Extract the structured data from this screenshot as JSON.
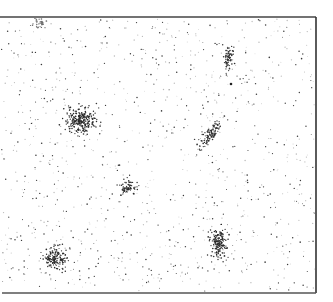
{
  "figure": {
    "width": 333,
    "height": 302,
    "background": "#ffffff",
    "frame": {
      "top_y": 17,
      "right_x": 316,
      "bottom_y": 293,
      "left_x": 0,
      "top_line": {
        "x1": 0,
        "x2": 316,
        "color": "#444444",
        "width": 1.6
      },
      "right_line": {
        "y1": 17,
        "y2": 293,
        "color": "#333333",
        "width": 1.6
      },
      "bottom_line": {
        "x1": 2,
        "x2": 316,
        "color": "#555555",
        "width": 1.4
      },
      "left_line_visible": false
    },
    "background_field": {
      "dot_count": 1100,
      "dark_fraction": 0.45,
      "dark_color": "#3a3a3a",
      "light_color": "#b8b8b8",
      "dot_radius": [
        0.45,
        0.8
      ],
      "seed": 17
    },
    "clusters": [
      {
        "name": "cluster-top-left-edge",
        "cx": 40,
        "cy": 22,
        "sx": 4,
        "sy": 3,
        "angle": 0,
        "count": 40,
        "color": "#6a6a6a",
        "truncated_above": 17
      },
      {
        "name": "cluster-large-left",
        "cx": 80,
        "cy": 121,
        "sx": 7.5,
        "sy": 6.5,
        "angle": 0,
        "count": 260,
        "color": "#2a2a2a"
      },
      {
        "name": "cluster-upper-right-elongated",
        "cx": 229,
        "cy": 58,
        "sx": 2.6,
        "sy": 6.2,
        "angle": 8,
        "count": 75,
        "color": "#2f2f2f"
      },
      {
        "name": "cluster-middle-right-diagonal",
        "cx": 211,
        "cy": 134,
        "sx": 2.6,
        "sy": 8.5,
        "angle": 35,
        "count": 110,
        "color": "#2f2f2f"
      },
      {
        "name": "cluster-small-center",
        "cx": 128,
        "cy": 187,
        "sx": 4,
        "sy": 4,
        "angle": 0,
        "count": 70,
        "color": "#2a2a2a"
      },
      {
        "name": "cluster-bottom-left",
        "cx": 55,
        "cy": 258,
        "sx": 6,
        "sy": 5.5,
        "angle": 0,
        "count": 150,
        "color": "#2a2a2a"
      },
      {
        "name": "cluster-bottom-right",
        "cx": 219,
        "cy": 243,
        "sx": 4.5,
        "sy": 7,
        "angle": 0,
        "count": 160,
        "color": "#2a2a2a"
      }
    ],
    "isolated_marks": [
      {
        "x": 231,
        "y": 84,
        "r": 1.3,
        "color": "#222222"
      }
    ]
  }
}
